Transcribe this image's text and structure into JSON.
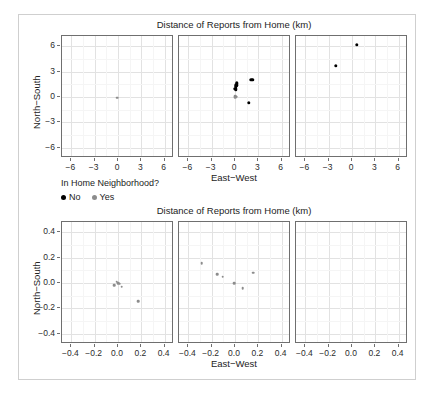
{
  "figure": {
    "background": "#ffffff",
    "border_color": "#cfcfcf"
  },
  "legend": {
    "title": "In Home Neighborhood?",
    "items": [
      {
        "label": "No",
        "color": "#000000",
        "key": "no"
      },
      {
        "label": "Yes",
        "color": "#8c8c8c",
        "key": "yes"
      }
    ]
  },
  "chart_data": [
    {
      "id": "top",
      "type": "scatter",
      "title": "Distance of Reports from Home (km)",
      "xlabel": "East−West",
      "ylabel": "North−South",
      "xlim": [
        -7.2,
        7.2
      ],
      "ylim": [
        -7.2,
        7.2
      ],
      "xticks": [
        -6,
        -3,
        0,
        3,
        6
      ],
      "yticks": [
        -6,
        -3,
        0,
        3,
        6
      ],
      "xticklabels": [
        "−6",
        "−3",
        "0",
        "3",
        "6"
      ],
      "yticklabels": [
        "−6",
        "−3",
        "0",
        "3",
        "6"
      ],
      "grid": true,
      "legend_position": "below-plot-left",
      "facets": [
        {
          "index": 0,
          "points": [
            {
              "x": -0.1,
              "y": -0.1,
              "group": "yes"
            }
          ]
        },
        {
          "index": 1,
          "points": [
            {
              "x": 0.2,
              "y": 1.6,
              "group": "no"
            },
            {
              "x": 0.15,
              "y": 1.4,
              "group": "no"
            },
            {
              "x": 0.1,
              "y": 1.2,
              "group": "no"
            },
            {
              "x": 0.05,
              "y": 1.0,
              "group": "no"
            },
            {
              "x": 0.1,
              "y": 0.85,
              "group": "no"
            },
            {
              "x": 2.1,
              "y": 2.0,
              "group": "no"
            },
            {
              "x": 2.3,
              "y": 2.05,
              "group": "no"
            },
            {
              "x": 1.8,
              "y": -0.7,
              "group": "no"
            },
            {
              "x": 0.05,
              "y": 0.1,
              "group": "yes"
            },
            {
              "x": 0.15,
              "y": 0.05,
              "group": "yes"
            },
            {
              "x": 0.0,
              "y": 0.0,
              "group": "yes"
            }
          ]
        },
        {
          "index": 2,
          "points": [
            {
              "x": 0.6,
              "y": 6.15,
              "group": "no"
            },
            {
              "x": -2.1,
              "y": 3.7,
              "group": "no"
            }
          ]
        }
      ]
    },
    {
      "id": "bottom",
      "type": "scatter",
      "title": "Distance of Reports from Home (km)",
      "xlabel": "East−West",
      "ylabel": "North−South",
      "xlim": [
        -0.48,
        0.48
      ],
      "ylim": [
        -0.48,
        0.48
      ],
      "xticks": [
        -0.4,
        -0.2,
        0.0,
        0.2,
        0.4
      ],
      "yticks": [
        -0.4,
        -0.2,
        0.0,
        0.2,
        0.4
      ],
      "xticklabels": [
        "−0.4",
        "−0.2",
        "0.0",
        "0.2",
        "0.4"
      ],
      "yticklabels": [
        "−0.4",
        "−0.2",
        "0.0",
        "0.2",
        "0.4"
      ],
      "grid": true,
      "facets": [
        {
          "index": 0,
          "points": [
            {
              "x": -0.035,
              "y": -0.015,
              "group": "yes"
            },
            {
              "x": -0.01,
              "y": 0.01,
              "group": "yes"
            },
            {
              "x": 0.0,
              "y": 0.0,
              "group": "yes"
            },
            {
              "x": 0.015,
              "y": -0.005,
              "group": "yes"
            },
            {
              "x": 0.03,
              "y": -0.03,
              "group": "yes"
            },
            {
              "x": 0.175,
              "y": -0.145,
              "group": "yes"
            }
          ]
        },
        {
          "index": 1,
          "points": [
            {
              "x": -0.285,
              "y": 0.155,
              "group": "yes"
            },
            {
              "x": -0.155,
              "y": 0.07,
              "group": "yes"
            },
            {
              "x": -0.105,
              "y": 0.05,
              "group": "yes"
            },
            {
              "x": -0.005,
              "y": 0.0,
              "group": "yes"
            },
            {
              "x": 0.065,
              "y": -0.04,
              "group": "yes"
            },
            {
              "x": 0.155,
              "y": 0.08,
              "group": "yes"
            }
          ]
        },
        {
          "index": 2,
          "points": []
        }
      ]
    }
  ]
}
